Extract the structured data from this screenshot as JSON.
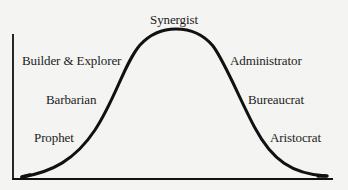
{
  "diagram": {
    "type": "bell-curve",
    "title": "",
    "peak_label": "Synergist",
    "rising_side": [
      {
        "label": "Builder & Explorer",
        "position": "upper"
      },
      {
        "label": "Barbarian",
        "position": "middle"
      },
      {
        "label": "Prophet",
        "position": "lower"
      }
    ],
    "falling_side": [
      {
        "label": "Administrator",
        "position": "upper"
      },
      {
        "label": "Bureaucrat",
        "position": "middle"
      },
      {
        "label": "Aristocrat",
        "position": "lower"
      }
    ],
    "colors": {
      "background": "#f4f4f2",
      "line": "#111111",
      "text": "#1c1c1c"
    }
  },
  "labels": {
    "synergist": "Synergist",
    "builder_explorer": "Builder & Explorer",
    "administrator": "Administrator",
    "barbarian": "Barbarian",
    "bureaucrat": "Bureaucrat",
    "prophet": "Prophet",
    "aristocrat": "Aristocrat"
  }
}
